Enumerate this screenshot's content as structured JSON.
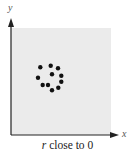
{
  "chart_data": {
    "type": "scatter",
    "title": "",
    "caption_var": "r",
    "caption_rest": " close to 0",
    "xlabel": "x",
    "ylabel": "y",
    "grid": false,
    "background": "#ebebeb",
    "point_color": "#111111",
    "points": [
      {
        "x": 40.3,
        "y": 67.3
      },
      {
        "x": 50.7,
        "y": 65.7
      },
      {
        "x": 58.0,
        "y": 68.3
      },
      {
        "x": 38.0,
        "y": 77.7
      },
      {
        "x": 52.0,
        "y": 74.3
      },
      {
        "x": 61.3,
        "y": 75.7
      },
      {
        "x": 61.3,
        "y": 81.7
      },
      {
        "x": 42.7,
        "y": 85.0
      },
      {
        "x": 48.0,
        "y": 85.0
      },
      {
        "x": 58.3,
        "y": 87.7
      },
      {
        "x": 52.0,
        "y": 90.3
      }
    ]
  }
}
